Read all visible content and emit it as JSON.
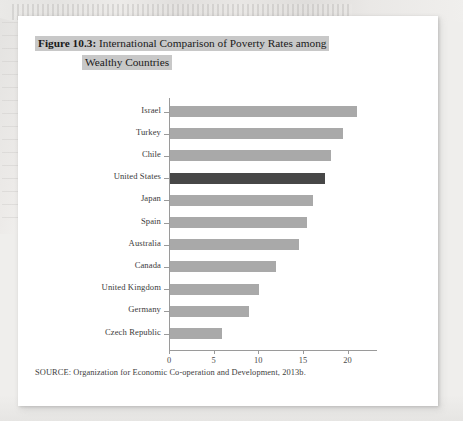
{
  "figure": {
    "title_label": "Figure 10.3:",
    "title_line_1": " International Comparison of Poverty Rates among",
    "title_line_2": "Wealthy Countries",
    "source": "SOURCE: Organization for Economic Co-operation and Development, 2013b."
  },
  "colors": {
    "bar": "#a9a9a9",
    "bar_highlight": "#474747",
    "title_highlight": "#c8c8c8",
    "axis": "#9a9a9a",
    "page": "#ffffff"
  },
  "chart_data": {
    "type": "bar",
    "orientation": "horizontal",
    "title": "Figure 10.3: International Comparison of Poverty Rates among Wealthy Countries",
    "xlabel": "",
    "ylabel": "",
    "xlim": [
      0,
      23.3
    ],
    "grid": false,
    "legend": "none",
    "highlighted_category": "United States",
    "xticks": [
      0,
      5,
      10,
      15,
      20
    ],
    "xtick_labels": [
      "0",
      "5",
      "10",
      "15",
      "20"
    ],
    "categories": [
      "Israel",
      "Turkey",
      "Chile",
      "United States",
      "Japan",
      "Spain",
      "Australia",
      "Canada",
      "United Kingdom",
      "Germany",
      "Czech Republic"
    ],
    "values": [
      21.0,
      19.4,
      18.0,
      17.4,
      16.0,
      15.4,
      14.4,
      11.9,
      10.0,
      8.8,
      5.8
    ]
  }
}
